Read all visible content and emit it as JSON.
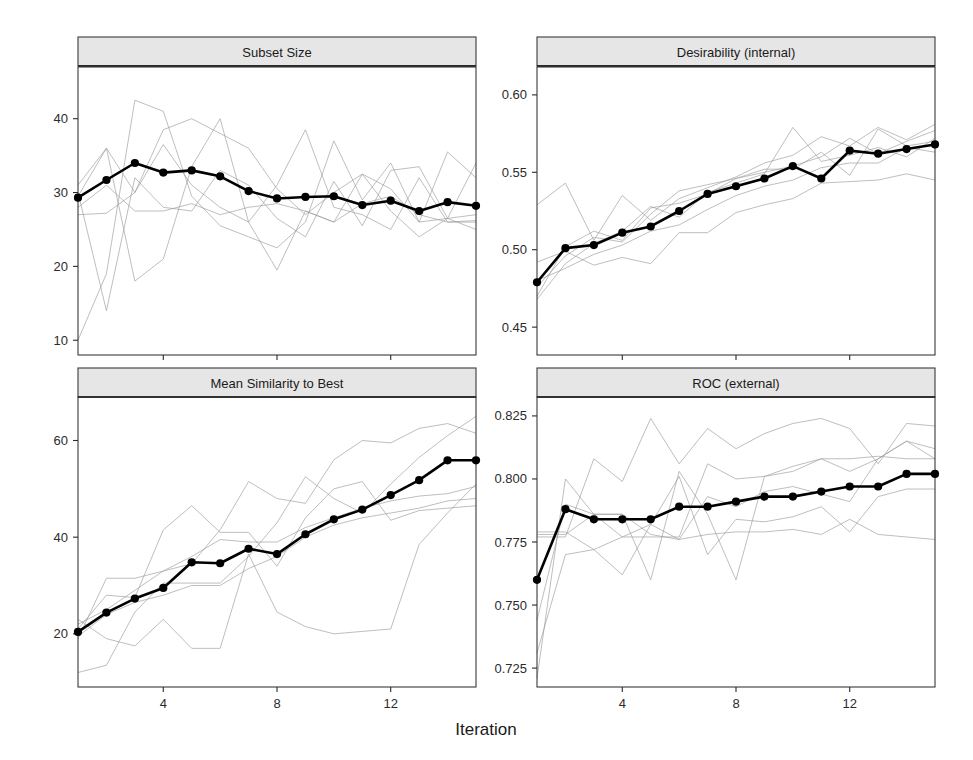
{
  "figure": {
    "xlabel": "Iteration",
    "panel_layout": "2x2",
    "background": "#ffffff",
    "mean_line_color": "#000000",
    "resample_line_color": "#9a9a9a",
    "strip_fill": "#e6e6e6"
  },
  "chart_data": [
    {
      "type": "line",
      "title": "Subset Size",
      "panel": "top-left",
      "xlabel": "Iteration",
      "ylabel": "",
      "xlim": [
        1,
        15
      ],
      "ylim": [
        8,
        47
      ],
      "xticks": [
        4,
        8,
        12
      ],
      "yticks": [
        10,
        20,
        30,
        40
      ],
      "grid": false,
      "legend": "none",
      "x": [
        1,
        2,
        3,
        4,
        5,
        6,
        7,
        8,
        9,
        10,
        11,
        12,
        13,
        14,
        15
      ],
      "series": [
        {
          "name": "Mean",
          "emphasis": "bold-with-points",
          "values": [
            29.3,
            31.7,
            34.0,
            32.7,
            33.0,
            32.2,
            30.2,
            29.2,
            29.4,
            29.5,
            28.3,
            28.9,
            27.5,
            28.7,
            28.2
          ]
        },
        {
          "name": "Resample 1",
          "emphasis": "faint",
          "values": [
            27.0,
            27.2,
            30.0,
            38.5,
            40.0,
            38.0,
            36.0,
            30.5,
            27.0,
            30.0,
            32.5,
            30.5,
            26.0,
            26.5,
            25.0
          ]
        },
        {
          "name": "Resample 2",
          "emphasis": "faint",
          "values": [
            29.5,
            36.0,
            30.0,
            36.5,
            31.0,
            28.0,
            26.0,
            31.0,
            38.5,
            28.0,
            27.0,
            25.0,
            32.0,
            26.0,
            26.2
          ]
        },
        {
          "name": "Resample 3",
          "emphasis": "faint",
          "values": [
            10.0,
            19.0,
            42.5,
            41.0,
            29.5,
            25.5,
            24.0,
            22.5,
            26.0,
            37.0,
            29.0,
            34.0,
            26.0,
            35.5,
            32.0
          ]
        },
        {
          "name": "Resample 4",
          "emphasis": "faint",
          "values": [
            31.0,
            36.0,
            18.0,
            21.0,
            33.5,
            40.0,
            26.0,
            19.5,
            27.5,
            26.0,
            32.5,
            27.5,
            24.0,
            26.5,
            27.0
          ]
        },
        {
          "name": "Resample 5",
          "emphasis": "faint",
          "values": [
            30.0,
            14.0,
            32.0,
            28.0,
            27.5,
            33.0,
            31.0,
            26.5,
            24.0,
            31.5,
            25.5,
            33.0,
            33.5,
            26.5,
            34.0
          ]
        },
        {
          "name": "Resample 6",
          "emphasis": "faint",
          "values": [
            28.0,
            31.0,
            27.5,
            27.5,
            28.5,
            27.0,
            28.0,
            28.5,
            27.5,
            26.0,
            28.5,
            29.5,
            27.0,
            26.0,
            26.0
          ]
        }
      ]
    },
    {
      "type": "line",
      "title": "Desirability (internal)",
      "panel": "top-right",
      "xlabel": "Iteration",
      "ylabel": "",
      "xlim": [
        1,
        15
      ],
      "ylim": [
        0.432,
        0.618
      ],
      "xticks": [
        4,
        8,
        12
      ],
      "yticks": [
        0.45,
        0.5,
        0.55,
        0.6
      ],
      "grid": false,
      "legend": "none",
      "x": [
        1,
        2,
        3,
        4,
        5,
        6,
        7,
        8,
        9,
        10,
        11,
        12,
        13,
        14,
        15
      ],
      "series": [
        {
          "name": "Mean",
          "emphasis": "bold-with-points",
          "values": [
            0.479,
            0.501,
            0.503,
            0.511,
            0.515,
            0.525,
            0.536,
            0.541,
            0.546,
            0.554,
            0.546,
            0.564,
            0.562,
            0.565,
            0.568
          ]
        },
        {
          "name": "Resample 1",
          "emphasis": "faint",
          "values": [
            0.529,
            0.543,
            0.506,
            0.535,
            0.519,
            0.533,
            0.54,
            0.547,
            0.556,
            0.561,
            0.573,
            0.567,
            0.579,
            0.571,
            0.581
          ]
        },
        {
          "name": "Resample 2",
          "emphasis": "faint",
          "values": [
            0.468,
            0.491,
            0.504,
            0.512,
            0.528,
            0.521,
            0.537,
            0.543,
            0.549,
            0.579,
            0.557,
            0.561,
            0.566,
            0.56,
            0.572
          ]
        },
        {
          "name": "Resample 3",
          "emphasis": "faint",
          "values": [
            0.476,
            0.496,
            0.508,
            0.505,
            0.523,
            0.538,
            0.542,
            0.546,
            0.552,
            0.552,
            0.563,
            0.548,
            0.578,
            0.567,
            0.57
          ]
        },
        {
          "name": "Resample 4",
          "emphasis": "faint",
          "values": [
            0.48,
            0.488,
            0.497,
            0.503,
            0.512,
            0.516,
            0.526,
            0.535,
            0.541,
            0.545,
            0.553,
            0.556,
            0.556,
            0.566,
            0.563
          ]
        },
        {
          "name": "Resample 5",
          "emphasis": "faint",
          "values": [
            0.492,
            0.499,
            0.49,
            0.495,
            0.491,
            0.511,
            0.511,
            0.524,
            0.529,
            0.533,
            0.543,
            0.544,
            0.545,
            0.549,
            0.545
          ]
        },
        {
          "name": "Resample 6",
          "emphasis": "faint",
          "values": [
            0.47,
            0.502,
            0.512,
            0.506,
            0.527,
            0.53,
            0.536,
            0.546,
            0.55,
            0.554,
            0.56,
            0.572,
            0.562,
            0.57,
            0.577
          ]
        }
      ]
    },
    {
      "type": "line",
      "title": "Mean Similarity to Best",
      "panel": "bottom-left",
      "xlabel": "Iteration",
      "ylabel": "",
      "xlim": [
        1,
        15
      ],
      "ylim": [
        9,
        69
      ],
      "xticks": [
        4,
        8,
        12
      ],
      "yticks": [
        20,
        40,
        60
      ],
      "grid": false,
      "legend": "none",
      "x": [
        1,
        2,
        3,
        4,
        5,
        6,
        7,
        8,
        9,
        10,
        11,
        12,
        13,
        14,
        15
      ],
      "series": [
        {
          "name": "Mean",
          "emphasis": "bold-with-points",
          "values": [
            20.4,
            24.4,
            27.3,
            29.5,
            34.8,
            34.6,
            37.6,
            36.5,
            40.6,
            43.7,
            45.7,
            48.7,
            51.8,
            55.9,
            55.9
          ]
        },
        {
          "name": "Resample 1",
          "emphasis": "faint",
          "values": [
            21.0,
            28.0,
            27.5,
            41.5,
            46.5,
            41.0,
            41.0,
            34.0,
            44.0,
            50.0,
            51.5,
            43.5,
            45.5,
            46.0,
            46.5
          ]
        },
        {
          "name": "Resample 2",
          "emphasis": "faint",
          "values": [
            19.0,
            31.5,
            31.5,
            33.0,
            34.5,
            41.5,
            51.5,
            48.0,
            47.0,
            56.0,
            60.0,
            59.5,
            62.5,
            63.5,
            61.5
          ]
        },
        {
          "name": "Resample 3",
          "emphasis": "faint",
          "values": [
            12.0,
            13.5,
            24.5,
            30.5,
            30.5,
            30.5,
            36.0,
            43.0,
            52.5,
            48.0,
            45.0,
            51.0,
            56.5,
            61.0,
            65.0
          ]
        },
        {
          "name": "Resample 4",
          "emphasis": "faint",
          "values": [
            23.0,
            19.0,
            17.5,
            23.0,
            17.0,
            17.0,
            36.5,
            24.5,
            21.5,
            20.0,
            20.5,
            21.0,
            38.5,
            45.0,
            51.0
          ]
        },
        {
          "name": "Resample 5",
          "emphasis": "faint",
          "values": [
            22.0,
            25.0,
            29.0,
            33.0,
            36.0,
            39.5,
            39.0,
            39.0,
            42.0,
            44.0,
            46.0,
            47.5,
            48.5,
            49.0,
            50.5
          ]
        },
        {
          "name": "Resample 6",
          "emphasis": "faint",
          "values": [
            19.5,
            24.0,
            26.5,
            28.0,
            30.0,
            30.0,
            33.5,
            36.0,
            40.0,
            42.5,
            44.0,
            45.0,
            46.0,
            47.5,
            48.0
          ]
        }
      ]
    },
    {
      "type": "line",
      "title": "ROC (external)",
      "panel": "bottom-right",
      "xlabel": "Iteration",
      "ylabel": "",
      "xlim": [
        1,
        15
      ],
      "ylim": [
        0.7175,
        0.8325
      ],
      "xticks": [
        4,
        8,
        12
      ],
      "yticks": [
        0.725,
        0.75,
        0.775,
        0.8,
        0.825
      ],
      "grid": false,
      "legend": "none",
      "x": [
        1,
        2,
        3,
        4,
        5,
        6,
        7,
        8,
        9,
        10,
        11,
        12,
        13,
        14,
        15
      ],
      "series": [
        {
          "name": "Mean",
          "emphasis": "bold-with-points",
          "values": [
            0.76,
            0.788,
            0.784,
            0.784,
            0.784,
            0.789,
            0.789,
            0.791,
            0.793,
            0.793,
            0.795,
            0.797,
            0.797,
            0.802,
            0.802
          ]
        },
        {
          "name": "Resample 1",
          "emphasis": "faint",
          "values": [
            0.777,
            0.777,
            0.808,
            0.799,
            0.824,
            0.806,
            0.82,
            0.812,
            0.818,
            0.822,
            0.824,
            0.82,
            0.806,
            0.822,
            0.821
          ]
        },
        {
          "name": "Resample 2",
          "emphasis": "faint",
          "values": [
            0.721,
            0.8,
            0.786,
            0.786,
            0.76,
            0.803,
            0.786,
            0.76,
            0.801,
            0.803,
            0.808,
            0.803,
            0.808,
            0.815,
            0.808
          ]
        },
        {
          "name": "Resample 3",
          "emphasis": "faint",
          "values": [
            0.778,
            0.778,
            0.786,
            0.786,
            0.778,
            0.776,
            0.793,
            0.789,
            0.795,
            0.797,
            0.794,
            0.791,
            0.808,
            0.815,
            0.812
          ]
        },
        {
          "name": "Resample 4",
          "emphasis": "faint",
          "values": [
            0.779,
            0.779,
            0.772,
            0.777,
            0.777,
            0.777,
            0.806,
            0.8,
            0.801,
            0.805,
            0.808,
            0.808,
            0.809,
            0.808,
            0.808
          ]
        },
        {
          "name": "Resample 5",
          "emphasis": "faint",
          "values": [
            0.744,
            0.79,
            0.786,
            0.777,
            0.782,
            0.801,
            0.77,
            0.784,
            0.783,
            0.785,
            0.789,
            0.779,
            0.793,
            0.796,
            0.796
          ]
        },
        {
          "name": "Resample 6",
          "emphasis": "faint",
          "values": [
            0.731,
            0.77,
            0.772,
            0.762,
            0.782,
            0.776,
            0.778,
            0.779,
            0.779,
            0.78,
            0.778,
            0.784,
            0.778,
            0.777,
            0.776
          ]
        }
      ]
    }
  ]
}
